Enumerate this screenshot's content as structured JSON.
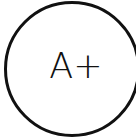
{
  "badge": {
    "text": "A+",
    "ring_color": "#111111",
    "background": "#ffffff"
  }
}
